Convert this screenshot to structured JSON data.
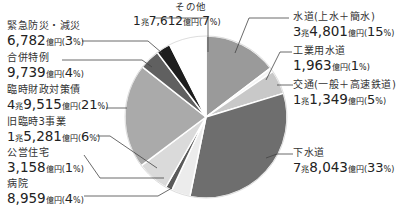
{
  "chart_data": {
    "type": "pie",
    "title": "",
    "unit": "億円",
    "start_angle": "12 o'clock",
    "direction": "clockwise",
    "slices": [
      {
        "label": "水道(上水+簡水)",
        "value_text": "3兆4,801億円",
        "value": 34801,
        "percent": 15,
        "color": "#9a9a9a"
      },
      {
        "label": "工業用水道",
        "value_text": "1,963億円",
        "value": 1963,
        "percent": 1,
        "color": "#f4f4f4"
      },
      {
        "label": "交通(一般+高速鉄道)",
        "value_text": "1兆1,349億円",
        "value": 11349,
        "percent": 5,
        "color": "#c8c8c8"
      },
      {
        "label": "下水道",
        "value_text": "7兆8,043億円",
        "value": 78043,
        "percent": 33,
        "color": "#6e6e6e"
      },
      {
        "label": "病院",
        "value_text": "8,959億円",
        "value": 8959,
        "percent": 4,
        "color": "#ececec"
      },
      {
        "label": "公営住宅",
        "value_text": "3,158億円",
        "value": 3158,
        "percent": 1,
        "color": "#5a5a5a"
      },
      {
        "label": "旧臨時3事業",
        "value_text": "1兆5,281億円",
        "value": 15281,
        "percent": 6,
        "color": "#dadada"
      },
      {
        "label": "臨時財政対策債",
        "value_text": "4兆9,515億円",
        "value": 49515,
        "percent": 21,
        "color": "#aaaaaa"
      },
      {
        "label": "合併特例",
        "value_text": "9,739億円",
        "value": 9739,
        "percent": 4,
        "color": "#606060"
      },
      {
        "label": "緊急防災・減災",
        "value_text": "6,782億円",
        "value": 6782,
        "percent": 3,
        "color": "#1e1e1e"
      },
      {
        "label": "その他",
        "value_text": "1兆7,612億円",
        "value": 17612,
        "percent": 7,
        "color": "#ffffff"
      }
    ],
    "legend": "callout labels"
  },
  "labels": {
    "sonota": {
      "name": "その他",
      "v1": "1",
      "u1": "兆",
      "v2": "7,612",
      "u2": "億円",
      "pct": "7"
    },
    "kinkyu": {
      "name": "緊急防災・減災",
      "v2": "6,782",
      "u2": "億円",
      "pct": "3"
    },
    "gappei": {
      "name": "合併特例",
      "v2": "9,739",
      "u2": "億円",
      "pct": "4"
    },
    "rinji": {
      "name": "臨時財政対策債",
      "v1": "4",
      "u1": "兆",
      "v2": "9,515",
      "u2": "億円",
      "pct": "21"
    },
    "kyurinji": {
      "name": "旧臨時3事業",
      "v1": "1",
      "u1": "兆",
      "v2": "5,281",
      "u2": "億円",
      "pct": "6"
    },
    "jutaku": {
      "name": "公営住宅",
      "v2": "3,158",
      "u2": "億円",
      "pct": "1"
    },
    "byoin": {
      "name": "病院",
      "v2": "8,959",
      "u2": "億円",
      "pct": "4"
    },
    "suido": {
      "name": "水道",
      "sub": "(上水＋簡水)",
      "v1": "3",
      "u1": "兆",
      "v2": "4,801",
      "u2": "億円",
      "pct": "15"
    },
    "kogyo": {
      "name": "工業用水道",
      "v2": "1,963",
      "u2": "億円",
      "pct": "1"
    },
    "kotsu": {
      "name": "交通",
      "sub": "(一般＋高速鉄道)",
      "v1": "1",
      "u1": "兆",
      "v2": "1,349",
      "u2": "億円",
      "pct": "5"
    },
    "gesuido": {
      "name": "下水道",
      "v1": "7",
      "u1": "兆",
      "v2": "8,043",
      "u2": "億円",
      "pct": "33"
    }
  },
  "pct_open": "(",
  "pct_unit": "%",
  "pct_close": ")"
}
